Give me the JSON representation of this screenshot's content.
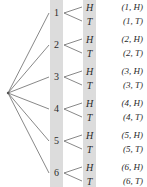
{
  "diagram": {
    "type": "probability-tree",
    "root": {
      "label": "",
      "x": 8,
      "y": 93
    },
    "line_color": "#555555",
    "band_color": "#dcdcdc",
    "text_color": "#2b2b2b",
    "stage1": {
      "name": "die-roll",
      "band_x": 50,
      "nodes": [
        {
          "label": "1",
          "y": 13
        },
        {
          "label": "2",
          "y": 45
        },
        {
          "label": "3",
          "y": 77
        },
        {
          "label": "4",
          "y": 109
        },
        {
          "label": "5",
          "y": 141
        },
        {
          "label": "6",
          "y": 173
        }
      ]
    },
    "stage2": {
      "name": "coin-toss",
      "band_x": 83,
      "nodes": [
        {
          "label": "H",
          "y": 7
        },
        {
          "label": "T",
          "y": 21
        },
        {
          "label": "H",
          "y": 39
        },
        {
          "label": "T",
          "y": 53
        },
        {
          "label": "H",
          "y": 71
        },
        {
          "label": "T",
          "y": 85
        },
        {
          "label": "H",
          "y": 103
        },
        {
          "label": "T",
          "y": 117
        },
        {
          "label": "H",
          "y": 135
        },
        {
          "label": "T",
          "y": 149
        },
        {
          "label": "H",
          "y": 167
        },
        {
          "label": "T",
          "y": 181
        }
      ]
    },
    "outcomes": [
      {
        "label": "(1, H)",
        "y": 7
      },
      {
        "label": "(1, T)",
        "y": 21
      },
      {
        "label": "(2, H)",
        "y": 39
      },
      {
        "label": "(2, T)",
        "y": 53
      },
      {
        "label": "(3, H)",
        "y": 71
      },
      {
        "label": "(3, T)",
        "y": 85
      },
      {
        "label": "(4, H)",
        "y": 103
      },
      {
        "label": "(4, T)",
        "y": 117
      },
      {
        "label": "(5, H)",
        "y": 135
      },
      {
        "label": "(5, T)",
        "y": 149
      },
      {
        "label": "(6, H)",
        "y": 167
      },
      {
        "label": "(6, T)",
        "y": 181
      }
    ]
  }
}
